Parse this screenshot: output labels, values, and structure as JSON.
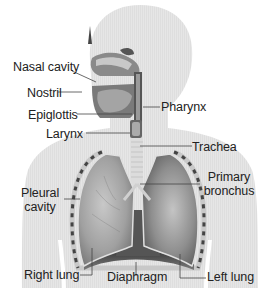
{
  "diagram": {
    "colors": {
      "background": "#ffffff",
      "silhouette": "#e4e4e4",
      "lung": "#9a9a9a",
      "lung_dark": "#5a5a5a",
      "trachea": "#d8d8d8",
      "leader_line": "#444444",
      "text": "#222222"
    },
    "labels": {
      "nasal_cavity": "Nasal cavity",
      "nostril": "Nostril",
      "epiglottis": "Epiglottis",
      "larynx": "Larynx",
      "pharynx": "Pharynx",
      "trachea": "Trachea",
      "primary_bronchus_line1": "Primary",
      "primary_bronchus_line2": "bronchus",
      "pleural_cavity_line1": "Pleural",
      "pleural_cavity_line2": "cavity",
      "right_lung": "Right lung",
      "diaphragm": "Diaphragm",
      "left_lung": "Left lung"
    }
  }
}
